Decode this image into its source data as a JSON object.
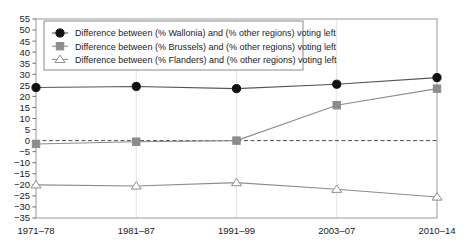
{
  "chart_data": {
    "type": "line",
    "title": "",
    "xlabel": "",
    "ylabel": "",
    "categories": [
      "1971–78",
      "1981–87",
      "1991–99",
      "2003–07",
      "2010–14"
    ],
    "ylim": [
      -35,
      55
    ],
    "ytick_step": 5,
    "yticks": [
      55,
      50,
      45,
      40,
      35,
      30,
      25,
      20,
      15,
      10,
      5,
      0,
      -5,
      -10,
      -15,
      -20,
      -25,
      -30,
      -35
    ],
    "ytick_labels": [
      "55",
      "50",
      "45",
      "40",
      "35",
      "30",
      "25",
      "20",
      "15",
      "10",
      "5",
      "0",
      "−5",
      "−10",
      "−15",
      "−20",
      "−25",
      "−30",
      "−35"
    ],
    "grid": "vertical-only",
    "zero_line": {
      "value": 0,
      "style": "dashed",
      "color": "#4d4d4d"
    },
    "legend_position": "top-left",
    "series": [
      {
        "name": "Difference between (% Wallonia) and (% other regions) voting left",
        "marker": "filled-circle",
        "color": "#111111",
        "line_color": "#555555",
        "values": [
          24,
          24.5,
          23.5,
          25.5,
          28.5
        ]
      },
      {
        "name": "Difference between (% Brussels) and (% other regions) voting left",
        "marker": "filled-square",
        "color": "#8c8c8c",
        "line_color": "#8c8c8c",
        "values": [
          -1.5,
          -0.5,
          0,
          16,
          23.5
        ]
      },
      {
        "name": "Difference between (% Flanders) and (% other regions) voting left",
        "marker": "open-triangle",
        "color": "#8c8c8c",
        "line_color": "#8c8c8c",
        "values": [
          -20,
          -20.5,
          -19,
          -22,
          -25.5
        ]
      }
    ]
  }
}
